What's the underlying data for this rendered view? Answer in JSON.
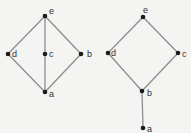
{
  "diagrams": [
    {
      "name": "left-lattice",
      "nodes": [
        {
          "id": "e",
          "label": "e",
          "x": 45,
          "y": 16,
          "lx": 49,
          "ly": 14
        },
        {
          "id": "d",
          "label": "d",
          "x": 8,
          "y": 54,
          "lx": 12,
          "ly": 57
        },
        {
          "id": "c",
          "label": "c",
          "x": 45,
          "y": 54,
          "lx": 49,
          "ly": 57
        },
        {
          "id": "b",
          "label": "b",
          "x": 81,
          "y": 54,
          "lx": 87,
          "ly": 57
        },
        {
          "id": "a",
          "label": "a",
          "x": 45,
          "y": 92,
          "lx": 49,
          "ly": 97
        }
      ],
      "edges": [
        [
          "e",
          "d"
        ],
        [
          "e",
          "c"
        ],
        [
          "e",
          "b"
        ],
        [
          "c",
          "a"
        ],
        [
          "d",
          "a"
        ],
        [
          "b",
          "a"
        ]
      ]
    },
    {
      "name": "right-lattice",
      "nodes": [
        {
          "id": "e",
          "label": "e",
          "x": 143,
          "y": 17,
          "lx": 143,
          "ly": 13
        },
        {
          "id": "d",
          "label": "d",
          "x": 108,
          "y": 53,
          "lx": 111,
          "ly": 56
        },
        {
          "id": "c",
          "label": "c",
          "x": 178,
          "y": 53,
          "lx": 182,
          "ly": 57
        },
        {
          "id": "b",
          "label": "b",
          "x": 142,
          "y": 91,
          "lx": 147,
          "ly": 96
        },
        {
          "id": "a",
          "label": "a",
          "x": 143,
          "y": 128,
          "lx": 147,
          "ly": 132
        }
      ],
      "edges": [
        [
          "e",
          "d"
        ],
        [
          "e",
          "c"
        ],
        [
          "d",
          "b"
        ],
        [
          "c",
          "b"
        ],
        [
          "b",
          "a"
        ]
      ]
    }
  ]
}
